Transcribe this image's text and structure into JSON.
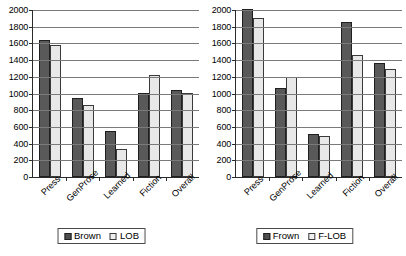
{
  "chart_data": [
    {
      "type": "bar",
      "panel": "left",
      "title": "",
      "xlabel": "",
      "ylabel": "",
      "ylim": [
        0,
        2000
      ],
      "ytick_step": 200,
      "yticks": [
        2000,
        1800,
        1600,
        1400,
        1200,
        1000,
        800,
        600,
        400,
        200,
        0
      ],
      "grid": true,
      "legend_position": "bottom",
      "categories": [
        "Press",
        "GenProse",
        "Learned",
        "Fiction",
        "Overall"
      ],
      "series": [
        {
          "name": "Brown",
          "color": "#595959",
          "values": [
            1640,
            945,
            550,
            1010,
            1045
          ]
        },
        {
          "name": "LOB",
          "color": "#e8e8e8",
          "values": [
            1580,
            865,
            330,
            1220,
            1010
          ]
        }
      ]
    },
    {
      "type": "bar",
      "panel": "right",
      "title": "",
      "xlabel": "",
      "ylabel": "",
      "ylim": [
        0,
        2000
      ],
      "ytick_step": 200,
      "yticks": [
        2000,
        1800,
        1600,
        1400,
        1200,
        1000,
        800,
        600,
        400,
        200,
        0
      ],
      "grid": true,
      "legend_position": "bottom",
      "categories": [
        "Press",
        "GenProse",
        "Learned",
        "Fiction",
        "Overall"
      ],
      "series": [
        {
          "name": "Frown",
          "color": "#595959",
          "values": [
            2010,
            1070,
            520,
            1860,
            1360
          ]
        },
        {
          "name": "F-LOB",
          "color": "#e8e8e8",
          "values": [
            1910,
            1195,
            490,
            1465,
            1295
          ]
        }
      ]
    }
  ]
}
